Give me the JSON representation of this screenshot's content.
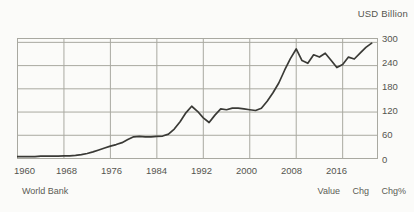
{
  "chart_data": {
    "type": "line",
    "title": "USD Billion",
    "xlabel": "",
    "ylabel": "USD Billion",
    "ylim": [
      0,
      310
    ],
    "xlim": [
      1960,
      2022
    ],
    "yticks": [
      0,
      60,
      120,
      180,
      240,
      300
    ],
    "xticks": [
      1960,
      1968,
      1976,
      1984,
      1992,
      2000,
      2008,
      2016
    ],
    "grid": true,
    "legend": "none",
    "line_color": "#3a3a36",
    "grid_color": "#a9a9a1",
    "background": "#fbfbf9",
    "source": "World Bank",
    "series": [
      {
        "name": "Value",
        "x": [
          1960,
          1961,
          1962,
          1963,
          1964,
          1965,
          1966,
          1967,
          1968,
          1969,
          1970,
          1971,
          1972,
          1973,
          1974,
          1975,
          1976,
          1977,
          1978,
          1979,
          1980,
          1981,
          1982,
          1983,
          1984,
          1985,
          1986,
          1987,
          1988,
          1989,
          1990,
          1991,
          1992,
          1993,
          1994,
          1995,
          1996,
          1997,
          1998,
          1999,
          2000,
          2001,
          2002,
          2003,
          2004,
          2005,
          2006,
          2007,
          2008,
          2009,
          2010,
          2011,
          2012,
          2013,
          2014,
          2015,
          2016,
          2017,
          2018,
          2019,
          2020,
          2021
        ],
        "values": [
          5,
          5,
          5,
          5,
          6,
          6,
          6,
          6,
          7,
          7,
          8,
          10,
          13,
          17,
          22,
          27,
          32,
          36,
          41,
          49,
          56,
          57,
          56,
          56,
          57,
          58,
          63,
          76,
          95,
          118,
          135,
          122,
          105,
          93,
          112,
          128,
          126,
          130,
          130,
          128,
          126,
          124,
          130,
          148,
          170,
          195,
          228,
          258,
          283,
          253,
          246,
          268,
          262,
          272,
          254,
          235,
          243,
          262,
          257,
          272,
          287,
          298
        ]
      }
    ]
  },
  "header": {
    "unit_label": "USD Billion"
  },
  "axes": {
    "y_ticks": [
      "300",
      "240",
      "180",
      "120",
      "60",
      "0"
    ],
    "x_ticks": [
      "1960",
      "1968",
      "1976",
      "1984",
      "1992",
      "2000",
      "2008",
      "2016"
    ]
  },
  "footer": {
    "source": "World Bank",
    "columns": [
      "Value",
      "Chg",
      "Chg%"
    ]
  }
}
